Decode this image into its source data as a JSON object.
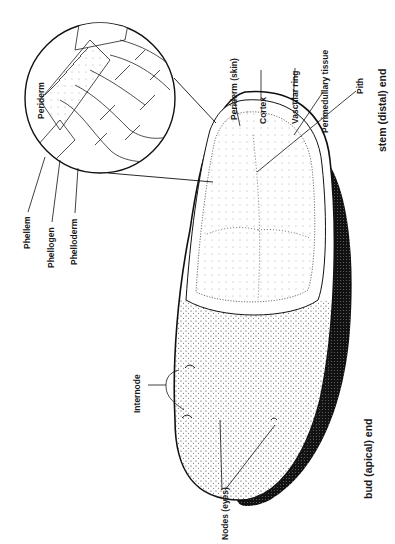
{
  "diagram": {
    "labels": {
      "periderm_inset": "Periderm",
      "phellem": "Phellem",
      "phellogen": "Phellogen",
      "phelloderm": "Phelloderm",
      "periderm_skin": "Periderm (skin)",
      "cortex": "Cortex",
      "vascular_ring": "Vascular ring",
      "perimedullary": "Perimedullary tissue",
      "pith": "Pith",
      "stem_end": "stem (distal) end",
      "internode": "Internode",
      "nodes": "Nodes (eyes)",
      "bud_end": "bud (apical) end"
    }
  }
}
